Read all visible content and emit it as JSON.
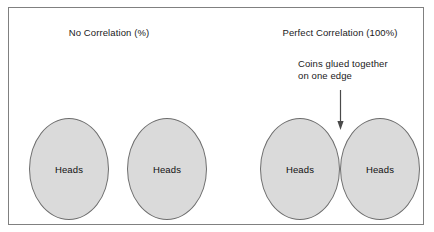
{
  "figure": {
    "title_left": "No Correlation (%)",
    "title_right": "Perfect Correlation (100%)",
    "annotation": {
      "line1": "Coins glued together",
      "line2": "on one edge"
    },
    "arrow": {
      "icon": "arrow-down-icon",
      "points_to": "junction between the two glued coins"
    },
    "colors": {
      "coin_fill": "#dadada",
      "coin_stroke": "#6e6e6e",
      "panel_border": "#808080",
      "background": "#ffffff",
      "text": "#1a1a1a"
    },
    "coins": [
      {
        "id": "coin-1",
        "label": "Heads",
        "group": "no-correlation"
      },
      {
        "id": "coin-2",
        "label": "Heads",
        "group": "no-correlation"
      },
      {
        "id": "coin-3",
        "label": "Heads",
        "group": "perfect-correlation"
      },
      {
        "id": "coin-4",
        "label": "Heads",
        "group": "perfect-correlation"
      }
    ]
  }
}
